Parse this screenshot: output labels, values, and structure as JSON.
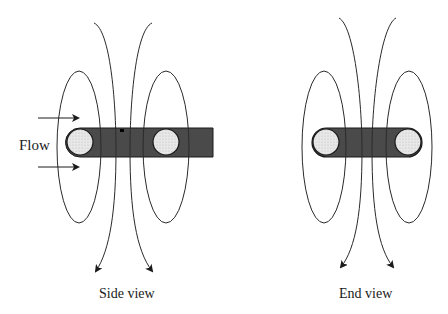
{
  "diagram": {
    "flow_label": "Flow",
    "captions": {
      "side": "Side view",
      "end": "End view"
    },
    "colors": {
      "bar_fill": "#4a4a4a",
      "circle_fill": "#e6e6e6",
      "line": "#2a2a2a",
      "background": "#ffffff"
    },
    "panels": [
      {
        "name": "side-view",
        "caption": "Side view",
        "elements": [
          "conductor bar",
          "two circular cross-sections",
          "flow arrows",
          "field line loops",
          "outgoing field arrows"
        ]
      },
      {
        "name": "end-view",
        "caption": "End view",
        "elements": [
          "rounded conductor bar",
          "two circular cross-sections",
          "field line loops",
          "outgoing field arrows"
        ]
      }
    ]
  }
}
